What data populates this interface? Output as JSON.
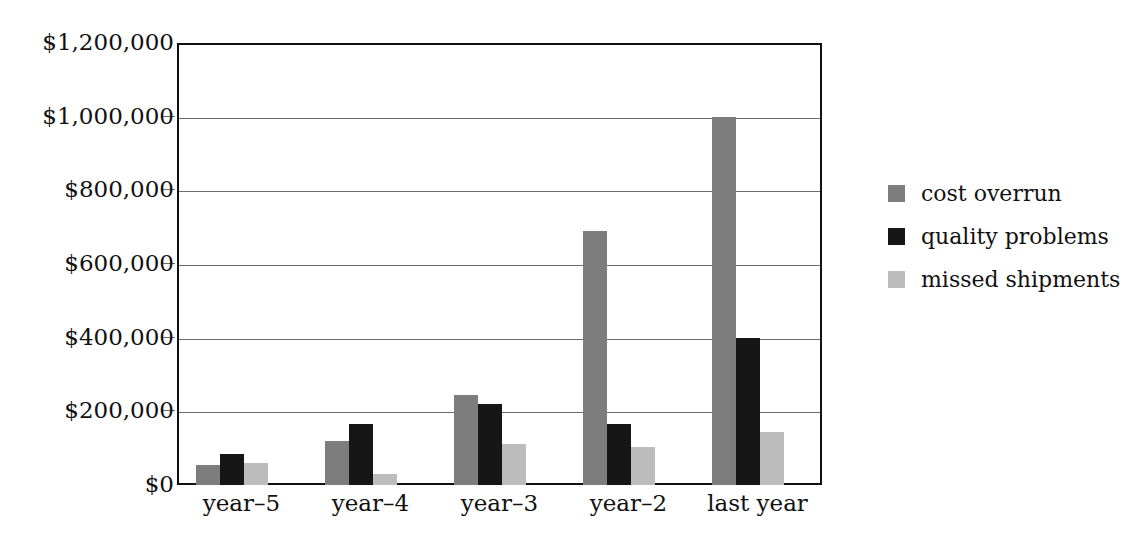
{
  "chart_data": {
    "type": "bar",
    "title": "",
    "subtitle": "",
    "xlabel": "",
    "ylabel": "",
    "categories": [
      "year–5",
      "year–4",
      "year–3",
      "year–2",
      "last year"
    ],
    "series": [
      {
        "name": "cost overrun",
        "color": "#7d7d7d",
        "values": [
          55000,
          120000,
          245000,
          690000,
          1000000
        ]
      },
      {
        "name": "quality problems",
        "color": "#161616",
        "values": [
          85000,
          165000,
          220000,
          165000,
          400000
        ]
      },
      {
        "name": "missed shipments",
        "color": "#bcbcbc",
        "values": [
          60000,
          30000,
          110000,
          103000,
          145000
        ]
      }
    ],
    "ylim": [
      0,
      1200000
    ],
    "ytick_values": [
      0,
      200000,
      400000,
      600000,
      800000,
      1000000,
      1200000
    ],
    "ytick_labels": [
      "$0",
      "$200,000",
      "$400,000",
      "$600,000",
      "$800,000",
      "$1,000,000",
      "$1,200,000"
    ],
    "grid": true,
    "legend_position": "right",
    "frame_color": "#111111",
    "gridline_color": "#6b6b6b",
    "background": "#ffffff"
  }
}
